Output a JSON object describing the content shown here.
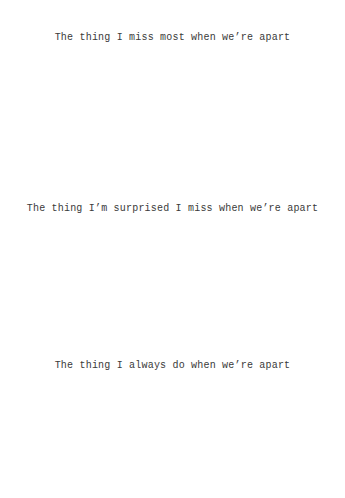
{
  "page": {
    "background_color": "#ffffff",
    "text_color": "#3a3a3a",
    "width": 345,
    "height": 498
  },
  "prompts": [
    {
      "text": "The thing I miss most when we’re apart"
    },
    {
      "text": "The thing I’m surprised I miss when we’re apart"
    },
    {
      "text": "The thing I always do when we’re apart"
    }
  ]
}
